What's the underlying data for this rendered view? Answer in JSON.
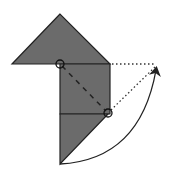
{
  "diagram": {
    "title": "Origami fold step",
    "colors": {
      "paper_fill": "#6b6b6b",
      "outline": "#222222",
      "background": "#ffffff",
      "guide": "#333333"
    },
    "shapes": {
      "top_triangle": {
        "points": "60,14 12,64 110,64"
      },
      "square_flap": {
        "points": "60,64 110,64 110,114 60,114"
      },
      "lower_flap": {
        "points": "60,114 108,114 60,164"
      }
    },
    "markers": {
      "pivot_circle_a": {
        "cx": 60,
        "cy": 64,
        "r": 4
      },
      "pivot_circle_b": {
        "cx": 108,
        "cy": 113,
        "r": 4
      }
    },
    "lines": {
      "fold_line": {
        "x1": 62,
        "y1": 66,
        "x2": 106,
        "y2": 111,
        "style": "dashed"
      },
      "guide_horizontal": {
        "x1": 110,
        "y1": 64,
        "x2": 156,
        "y2": 64,
        "style": "dotted"
      },
      "guide_diagonal": {
        "x1": 110,
        "y1": 111,
        "x2": 156,
        "y2": 66,
        "style": "dotted"
      }
    },
    "arrow": {
      "path": "M 60 164 Q 140 160 156 70",
      "direction": "fold up and to the right"
    }
  }
}
